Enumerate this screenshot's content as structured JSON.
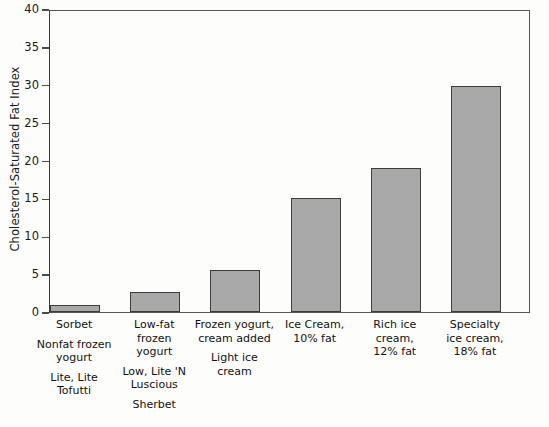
{
  "chart_data": {
    "type": "bar",
    "title": "",
    "xlabel": "",
    "ylabel": "Cholesterol-Saturated Fat Index",
    "ylim": [
      0,
      40
    ],
    "ytick_step": 5,
    "grid": false,
    "legend": "none",
    "bar_color": "#a9a9a9",
    "bar_edge_color": "#3c3c3c",
    "yticks": [
      "0",
      "5",
      "10",
      "15",
      "20",
      "25",
      "30",
      "35",
      "40"
    ],
    "categories": [
      "Sorbet",
      "Low-fat frozen yogurt",
      "Frozen yogurt, cream added",
      "Ice Cream, 10% fat",
      "Rich ice cream, 12% fat",
      "Specialty ice cream, 18% fat"
    ],
    "values": [
      0.9,
      2.7,
      5.6,
      15.0,
      19.0,
      29.8
    ],
    "category_label_groups": [
      [
        [
          "Sorbet"
        ],
        [
          "Nonfat frozen",
          "yogurt"
        ],
        [
          "Lite, Lite",
          "Tofutti"
        ]
      ],
      [
        [
          "Low-fat",
          "frozen",
          "yogurt"
        ],
        [
          "Low, Lite 'N",
          "Luscious"
        ],
        [
          "Sherbet"
        ]
      ],
      [
        [
          "Frozen yogurt,",
          "cream added"
        ],
        [
          "Light ice",
          "cream"
        ]
      ],
      [
        [
          "Ice Cream,",
          "10% fat"
        ]
      ],
      [
        [
          "Rich ice",
          "cream,",
          "12% fat"
        ]
      ],
      [
        [
          "Specialty",
          "ice cream,",
          "18% fat"
        ]
      ]
    ]
  }
}
